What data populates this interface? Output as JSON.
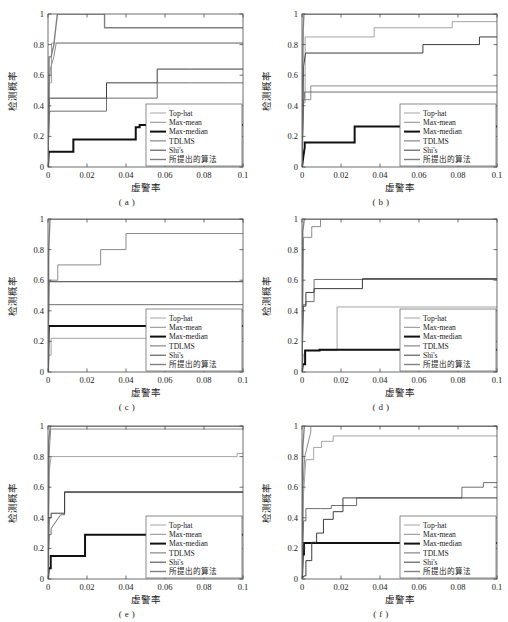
{
  "figure": {
    "panel_labels": [
      "( a )",
      "( b )",
      "( c )",
      "( d )",
      "( e )",
      "( f )"
    ],
    "axis": {
      "xlabel": "虚警率",
      "ylabel": "检测概率",
      "xticks": [
        "0",
        "0.02",
        "0.04",
        "0.06",
        "0.08",
        "0.1"
      ],
      "yticks": [
        "0",
        "0.2",
        "0.4",
        "0.6",
        "0.8",
        "1"
      ],
      "xlim": [
        0,
        0.1
      ],
      "ylim": [
        0,
        1
      ]
    },
    "legend": {
      "entries": [
        {
          "label": "Top-hat",
          "color": "#9a9a9a",
          "width": 0.9
        },
        {
          "label": "Max-mean",
          "color": "#8c8c8c",
          "width": 1.0
        },
        {
          "label": "Max-median",
          "color": "#111111",
          "width": 2.0
        },
        {
          "label": "TDLMS",
          "color": "#6e6e6e",
          "width": 1.0
        },
        {
          "label": "Shi's",
          "color": "#3d3d3d",
          "width": 1.0
        },
        {
          "label": "所提出的算法",
          "color": "#808080",
          "width": 1.4
        }
      ]
    }
  },
  "chart_data": [
    {
      "type": "line",
      "id": "a",
      "title": "( a )",
      "xlabel": "虚警率",
      "ylabel": "检测概率",
      "xlim": [
        0,
        0.1
      ],
      "ylim": [
        0,
        1
      ],
      "grid": false,
      "legend_position": "lower-right",
      "series": [
        {
          "name": "Top-hat",
          "x": [
            0,
            0.0008,
            0.0018,
            0.0018,
            0.1
          ],
          "y": [
            0,
            0.55,
            0.55,
            0.81,
            0.81
          ]
        },
        {
          "name": "Max-mean",
          "x": [
            0,
            0.0006,
            0.0012,
            0.003,
            0.0042,
            0.0042,
            0.1
          ],
          "y": [
            0,
            0.53,
            0.64,
            0.72,
            0.81,
            0.81,
            0.81
          ]
        },
        {
          "name": "Max-median",
          "x": [
            0,
            0.0004,
            0.013,
            0.013,
            0.045,
            0.045,
            0.047,
            0.047,
            0.1
          ],
          "y": [
            0,
            0.1,
            0.1,
            0.18,
            0.18,
            0.26,
            0.26,
            0.275,
            0.275
          ]
        },
        {
          "name": "TDLMS",
          "x": [
            0,
            0.0006,
            0.0012,
            0.0012,
            0.03,
            0.03,
            0.056,
            0.056,
            0.073,
            0.073,
            0.092,
            0.092,
            0.1
          ],
          "y": [
            0,
            0.36,
            0.36,
            0.365,
            0.365,
            0.45,
            0.45,
            0.55,
            0.55,
            0.55,
            0.55,
            0.55,
            0.55
          ]
        },
        {
          "name": "Shi's",
          "x": [
            0,
            0.0006,
            0.0014,
            0.0014,
            0.03,
            0.03,
            0.056,
            0.056,
            0.073,
            0.073,
            0.1
          ],
          "y": [
            0,
            0.45,
            0.45,
            0.45,
            0.45,
            0.55,
            0.55,
            0.64,
            0.64,
            0.64,
            0.64
          ]
        },
        {
          "name": "所提出的算法",
          "x": [
            0,
            0.0006,
            0.0016,
            0.003,
            0.0048,
            0.0048,
            0.029,
            0.029,
            0.1
          ],
          "y": [
            0,
            0.72,
            0.72,
            0.8,
            1.0,
            1.0,
            1.0,
            0.91,
            0.91
          ]
        }
      ]
    },
    {
      "type": "line",
      "id": "b",
      "title": "( b )",
      "xlabel": "虚警率",
      "ylabel": "检测概率",
      "xlim": [
        0,
        0.1
      ],
      "ylim": [
        0,
        1
      ],
      "grid": false,
      "legend_position": "lower-right",
      "series": [
        {
          "name": "Top-hat",
          "x": [
            0,
            0.0008,
            0.0016,
            0.0016,
            0.037,
            0.037,
            0.077,
            0.077,
            0.1
          ],
          "y": [
            0,
            0.42,
            0.42,
            0.85,
            0.85,
            0.91,
            0.91,
            0.95,
            0.95
          ]
        },
        {
          "name": "Max-mean",
          "x": [
            0,
            0.0008,
            0.0045,
            0.0045,
            0.1
          ],
          "y": [
            0,
            0.44,
            0.44,
            0.53,
            0.53
          ]
        },
        {
          "name": "Max-median",
          "x": [
            0,
            0.0006,
            0.0014,
            0.0014,
            0.027,
            0.027,
            0.05,
            0.05,
            0.1
          ],
          "y": [
            0,
            0.06,
            0.13,
            0.16,
            0.16,
            0.265,
            0.265,
            0.265,
            0.265
          ]
        },
        {
          "name": "TDLMS",
          "x": [
            0,
            0.0006,
            0.0012,
            0.0012,
            0.1
          ],
          "y": [
            0,
            0.41,
            0.45,
            0.49,
            0.49
          ]
        },
        {
          "name": "Shi's",
          "x": [
            0,
            0.0008,
            0.0018,
            0.0018,
            0.062,
            0.062,
            0.091,
            0.091,
            0.1
          ],
          "y": [
            0,
            0.66,
            0.74,
            0.745,
            0.745,
            0.8,
            0.8,
            0.85,
            0.85
          ]
        },
        {
          "name": "所提出的算法",
          "x": [
            0,
            0.0006,
            0.001,
            0.001,
            0.1
          ],
          "y": [
            0,
            0.9,
            1.0,
            1.0,
            1.0
          ]
        }
      ]
    },
    {
      "type": "line",
      "id": "c",
      "title": "( c )",
      "xlabel": "虚警率",
      "ylabel": "检测概率",
      "xlim": [
        0,
        0.1
      ],
      "ylim": [
        0,
        1
      ],
      "grid": false,
      "legend_position": "lower-right",
      "series": [
        {
          "name": "Top-hat",
          "x": [
            0,
            0.0004,
            0.0016,
            0.0016,
            0.1
          ],
          "y": [
            0,
            0.11,
            0.11,
            0.22,
            0.22
          ]
        },
        {
          "name": "Max-mean",
          "x": [
            0,
            0.0006,
            0.005,
            0.005,
            0.027,
            0.027,
            0.04,
            0.04,
            0.1
          ],
          "y": [
            0,
            0.6,
            0.6,
            0.7,
            0.7,
            0.8,
            0.8,
            0.905,
            0.905
          ]
        },
        {
          "name": "Max-median",
          "x": [
            0,
            0.0004,
            0.1
          ],
          "y": [
            0,
            0.3,
            0.3
          ]
        },
        {
          "name": "TDLMS",
          "x": [
            0,
            0.0004,
            0.1
          ],
          "y": [
            0,
            0.44,
            0.44
          ]
        },
        {
          "name": "Shi's",
          "x": [
            0,
            0.0004,
            0.1
          ],
          "y": [
            0,
            0.59,
            0.59
          ]
        },
        {
          "name": "所提出的算法",
          "x": [
            0,
            0.0004,
            0.001,
            0.001,
            0.1
          ],
          "y": [
            0,
            0.8,
            1.0,
            1.0,
            1.0
          ]
        }
      ]
    },
    {
      "type": "line",
      "id": "d",
      "title": "( d )",
      "xlabel": "虚警率",
      "ylabel": "检测概率",
      "xlim": [
        0,
        0.1
      ],
      "ylim": [
        0,
        1
      ],
      "grid": false,
      "legend_position": "lower-right",
      "series": [
        {
          "name": "Top-hat",
          "x": [
            0,
            0.0006,
            0.0014,
            0.0014,
            0.018,
            0.018,
            0.05,
            0.05,
            0.1
          ],
          "y": [
            0,
            0.1,
            0.13,
            0.14,
            0.14,
            0.425,
            0.425,
            0.425,
            0.425
          ]
        },
        {
          "name": "Max-mean",
          "x": [
            0,
            0.0008,
            0.005,
            0.005,
            0.0095,
            0.0095,
            0.1
          ],
          "y": [
            0,
            0.88,
            0.88,
            0.95,
            0.95,
            1.0,
            1.0
          ]
        },
        {
          "name": "Max-median",
          "x": [
            0,
            0.0004,
            0.0016,
            0.0016,
            0.009,
            0.009,
            0.1
          ],
          "y": [
            0,
            0.05,
            0.05,
            0.14,
            0.14,
            0.145,
            0.145
          ]
        },
        {
          "name": "TDLMS",
          "x": [
            0,
            0.0006,
            0.002,
            0.002,
            0.0062,
            0.0062,
            0.031,
            0.031,
            0.1
          ],
          "y": [
            0,
            0.44,
            0.44,
            0.46,
            0.46,
            0.605,
            0.605,
            0.605,
            0.605
          ]
        },
        {
          "name": "Shi's",
          "x": [
            0,
            0.0006,
            0.002,
            0.002,
            0.0062,
            0.0062,
            0.031,
            0.031,
            0.1
          ],
          "y": [
            0,
            0.43,
            0.43,
            0.52,
            0.52,
            0.545,
            0.545,
            0.61,
            0.61
          ]
        },
        {
          "name": "所提出的算法",
          "x": [
            0,
            0.0004,
            0.0012,
            0.0012,
            0.1
          ],
          "y": [
            0,
            0.92,
            1.0,
            1.0,
            1.0
          ]
        }
      ]
    },
    {
      "type": "line",
      "id": "e",
      "title": "( e )",
      "xlabel": "虚警率",
      "ylabel": "检测概率",
      "xlim": [
        0,
        0.1
      ],
      "ylim": [
        0,
        1
      ],
      "grid": false,
      "legend_position": "lower-right",
      "series": [
        {
          "name": "Top-hat",
          "x": [
            0,
            0.0006,
            0.0016,
            0.0016,
            0.097,
            0.097,
            0.1
          ],
          "y": [
            0,
            0.7,
            0.8,
            0.8,
            0.8,
            0.82,
            0.82
          ]
        },
        {
          "name": "Max-mean",
          "x": [
            0,
            0.0006,
            0.0014,
            0.0014,
            0.1
          ],
          "y": [
            0,
            0.82,
            0.98,
            0.98,
            0.98
          ]
        },
        {
          "name": "Max-median",
          "x": [
            0,
            0.0004,
            0.0014,
            0.0014,
            0.019,
            0.019,
            0.05,
            0.05,
            0.1
          ],
          "y": [
            0,
            0.07,
            0.07,
            0.15,
            0.15,
            0.29,
            0.29,
            0.29,
            0.29
          ]
        },
        {
          "name": "TDLMS",
          "x": [
            0,
            0.0006,
            0.0016,
            0.0016,
            0.0065,
            0.0065,
            0.0085,
            0.0085,
            0.1
          ],
          "y": [
            0,
            0.29,
            0.29,
            0.33,
            0.42,
            0.42,
            0.42,
            0.565,
            0.565
          ]
        },
        {
          "name": "Shi's",
          "x": [
            0,
            0.0006,
            0.0016,
            0.0016,
            0.0065,
            0.0065,
            0.0085,
            0.0085,
            0.1
          ],
          "y": [
            0,
            0.4,
            0.4,
            0.43,
            0.43,
            0.43,
            0.43,
            0.57,
            0.57
          ]
        },
        {
          "name": "所提出的算法",
          "x": [
            0,
            0.0004,
            0.0012,
            0.0012,
            0.1
          ],
          "y": [
            0,
            0.9,
            1.0,
            1.0,
            1.0
          ]
        }
      ]
    },
    {
      "type": "line",
      "id": "f",
      "title": "( f )",
      "xlabel": "虚警率",
      "ylabel": "检测概率",
      "xlim": [
        0,
        0.1
      ],
      "ylim": [
        0,
        1
      ],
      "grid": false,
      "legend_position": "lower-right",
      "series": [
        {
          "name": "Top-hat",
          "x": [
            0,
            0.0008,
            0.002,
            0.002,
            0.006,
            0.006,
            0.01,
            0.01,
            0.016,
            0.016,
            0.1
          ],
          "y": [
            0,
            0.56,
            0.78,
            0.78,
            0.78,
            0.86,
            0.86,
            0.9,
            0.9,
            0.935,
            0.935
          ]
        },
        {
          "name": "Max-mean",
          "x": [
            0,
            0.0006,
            0.0014,
            0.0014,
            0.0045,
            0.0045,
            0.1
          ],
          "y": [
            0,
            0.62,
            0.8,
            0.8,
            0.96,
            1.0,
            1.0
          ]
        },
        {
          "name": "Max-median",
          "x": [
            0,
            0.0004,
            0.001,
            0.001,
            0.1
          ],
          "y": [
            0,
            0.16,
            0.16,
            0.235,
            0.235
          ]
        },
        {
          "name": "TDLMS",
          "x": [
            0,
            0.0008,
            0.002,
            0.002,
            0.0095,
            0.0095,
            0.015,
            0.015,
            0.028,
            0.028,
            0.04,
            0.04,
            0.082,
            0.082,
            0.093,
            0.093,
            0.1
          ],
          "y": [
            0,
            0.38,
            0.38,
            0.46,
            0.46,
            0.46,
            0.46,
            0.48,
            0.48,
            0.53,
            0.53,
            0.53,
            0.53,
            0.6,
            0.6,
            0.63,
            0.63
          ]
        },
        {
          "name": "Shi's",
          "x": [
            0,
            0.001,
            0.002,
            0.002,
            0.005,
            0.005,
            0.0075,
            0.0075,
            0.011,
            0.011,
            0.016,
            0.016,
            0.021,
            0.021,
            0.1
          ],
          "y": [
            0,
            0.02,
            0.02,
            0.12,
            0.12,
            0.24,
            0.24,
            0.3,
            0.3,
            0.39,
            0.39,
            0.44,
            0.44,
            0.53,
            0.53
          ]
        },
        {
          "name": "所提出的算法",
          "x": [
            0,
            0.0004,
            0.0012,
            0.0012,
            0.005,
            0.005,
            0.1
          ],
          "y": [
            0,
            0.86,
            1.0,
            1.0,
            1.0,
            1.0,
            1.0
          ]
        }
      ]
    }
  ]
}
